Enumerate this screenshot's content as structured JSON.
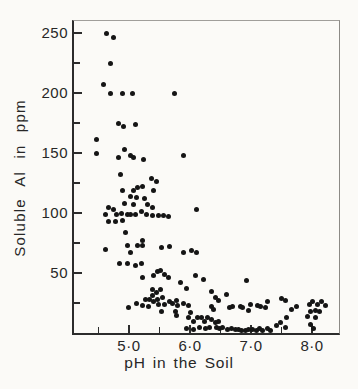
{
  "figure": {
    "colors": {
      "paper": "#fbfaf7",
      "ink": "#272727",
      "dot": "#151515",
      "axis": "#2c2c2c"
    }
  },
  "chart_data": {
    "type": "scatter",
    "title": "",
    "xlabel": "pH in the Soil",
    "ylabel": "Soluble Al in ppm",
    "xlim": [
      4.1,
      8.44
    ],
    "ylim": [
      0,
      260
    ],
    "grid": false,
    "legend": "none",
    "x_major_ticks": [
      {
        "value": 5.0,
        "label": "5·0"
      },
      {
        "value": 6.0,
        "label": "6·0"
      },
      {
        "value": 7.0,
        "label": "7·0"
      },
      {
        "value": 8.0,
        "label": "8·0"
      }
    ],
    "x_minor_ticks": [
      4.5,
      5.5,
      6.5,
      7.5
    ],
    "y_major_ticks": [
      {
        "value": 50,
        "label": "50"
      },
      {
        "value": 100,
        "label": "100"
      },
      {
        "value": 150,
        "label": "150"
      },
      {
        "value": 200,
        "label": "200"
      },
      {
        "value": 250,
        "label": "250"
      }
    ],
    "y_minor_ticks": [
      25,
      75,
      125,
      175,
      225
    ],
    "points": [
      [
        4.64,
        250
      ],
      [
        4.74,
        246
      ],
      [
        4.7,
        225
      ],
      [
        4.58,
        207
      ],
      [
        4.7,
        200
      ],
      [
        4.9,
        200
      ],
      [
        5.05,
        200
      ],
      [
        5.75,
        200
      ],
      [
        4.83,
        175
      ],
      [
        4.91,
        172
      ],
      [
        5.1,
        174
      ],
      [
        4.47,
        161
      ],
      [
        4.47,
        150
      ],
      [
        4.93,
        153
      ],
      [
        5.02,
        148
      ],
      [
        4.83,
        146
      ],
      [
        5.08,
        146
      ],
      [
        5.24,
        145
      ],
      [
        5.89,
        148
      ],
      [
        4.86,
        132
      ],
      [
        5.37,
        129
      ],
      [
        5.45,
        126
      ],
      [
        4.9,
        119
      ],
      [
        5.08,
        119
      ],
      [
        5.14,
        121
      ],
      [
        5.22,
        122
      ],
      [
        5.4,
        119
      ],
      [
        5.03,
        114
      ],
      [
        5.13,
        113
      ],
      [
        5.25,
        112
      ],
      [
        4.92,
        108
      ],
      [
        5.08,
        107
      ],
      [
        5.31,
        107
      ],
      [
        5.38,
        105
      ],
      [
        4.67,
        105
      ],
      [
        4.75,
        103
      ],
      [
        6.1,
        103
      ],
      [
        4.62,
        99
      ],
      [
        4.8,
        99
      ],
      [
        4.87,
        100
      ],
      [
        4.97,
        99
      ],
      [
        5.03,
        99
      ],
      [
        5.1,
        99
      ],
      [
        5.21,
        101
      ],
      [
        5.28,
        99
      ],
      [
        5.39,
        98
      ],
      [
        5.48,
        98
      ],
      [
        5.56,
        98
      ],
      [
        5.64,
        97
      ],
      [
        4.67,
        93
      ],
      [
        4.78,
        93
      ],
      [
        4.9,
        94
      ],
      [
        4.94,
        84
      ],
      [
        5.23,
        77
      ],
      [
        4.98,
        73
      ],
      [
        5.14,
        73
      ],
      [
        5.23,
        73
      ],
      [
        5.53,
        71
      ],
      [
        5.66,
        72
      ],
      [
        4.62,
        70
      ],
      [
        5.03,
        67
      ],
      [
        5.89,
        67
      ],
      [
        6.02,
        69
      ],
      [
        6.11,
        67
      ],
      [
        4.85,
        58
      ],
      [
        4.97,
        58
      ],
      [
        5.1,
        56
      ],
      [
        5.21,
        58
      ],
      [
        5.46,
        51
      ],
      [
        5.51,
        52
      ],
      [
        5.58,
        49
      ],
      [
        5.4,
        48
      ],
      [
        5.23,
        46
      ],
      [
        5.64,
        46
      ],
      [
        6.09,
        48
      ],
      [
        6.22,
        45
      ],
      [
        5.84,
        42
      ],
      [
        6.93,
        44
      ],
      [
        5.94,
        37
      ],
      [
        5.39,
        36
      ],
      [
        5.52,
        36
      ],
      [
        5.45,
        34
      ],
      [
        6.35,
        35
      ],
      [
        5.38,
        31
      ],
      [
        5.55,
        30
      ],
      [
        6.42,
        30
      ],
      [
        6.6,
        32
      ],
      [
        7.5,
        29
      ],
      [
        7.56,
        27
      ],
      [
        5.27,
        28
      ],
      [
        5.34,
        28
      ],
      [
        5.47,
        28
      ],
      [
        5.78,
        27
      ],
      [
        6.47,
        27
      ],
      [
        7.27,
        26
      ],
      [
        5.41,
        26
      ],
      [
        5.89,
        25
      ],
      [
        5.66,
        26
      ],
      [
        5.71,
        25
      ],
      [
        5.12,
        25
      ],
      [
        5.49,
        24
      ],
      [
        5.58,
        24
      ],
      [
        6.99,
        24
      ],
      [
        5.79,
        23
      ],
      [
        5.97,
        23
      ],
      [
        5.23,
        23
      ],
      [
        7.1,
        23
      ],
      [
        5.32,
        22
      ],
      [
        6.35,
        22
      ],
      [
        6.7,
        22
      ],
      [
        6.82,
        22
      ],
      [
        7.16,
        22
      ],
      [
        7.24,
        21
      ],
      [
        6.64,
        21
      ],
      [
        6.86,
        21
      ],
      [
        4.99,
        21
      ],
      [
        6.39,
        20
      ],
      [
        6.96,
        19
      ],
      [
        7.66,
        20
      ],
      [
        5.53,
        18
      ],
      [
        5.76,
        18
      ],
      [
        6.01,
        17
      ],
      [
        5.78,
        15
      ],
      [
        5.97,
        13
      ],
      [
        6.13,
        13
      ],
      [
        6.18,
        13
      ],
      [
        6.28,
        13
      ],
      [
        7.58,
        13
      ],
      [
        6.23,
        10
      ],
      [
        6.35,
        11
      ],
      [
        6.46,
        10
      ],
      [
        6.05,
        10
      ],
      [
        6.41,
        9
      ],
      [
        7.49,
        9
      ],
      [
        7.42,
        6
      ],
      [
        5.94,
        4
      ],
      [
        6.05,
        3
      ],
      [
        6.15,
        5
      ],
      [
        6.26,
        4
      ],
      [
        6.32,
        5
      ],
      [
        6.44,
        5
      ],
      [
        6.49,
        4
      ],
      [
        6.54,
        5
      ],
      [
        7.56,
        5
      ],
      [
        6.62,
        3
      ],
      [
        6.68,
        4
      ],
      [
        6.75,
        3
      ],
      [
        6.8,
        3
      ],
      [
        6.85,
        2.5
      ],
      [
        6.91,
        2.5
      ],
      [
        6.96,
        3
      ],
      [
        7.03,
        3
      ],
      [
        7.09,
        2.5
      ],
      [
        7.13,
        4
      ],
      [
        7.19,
        2.5
      ],
      [
        7.27,
        4
      ],
      [
        7.32,
        2.5
      ],
      [
        7.75,
        22
      ],
      [
        7.95,
        24
      ],
      [
        8.01,
        26
      ],
      [
        8.09,
        24
      ],
      [
        8.16,
        26
      ],
      [
        8.22,
        23
      ],
      [
        7.98,
        18
      ],
      [
        8.05,
        19
      ],
      [
        8.12,
        18
      ],
      [
        7.92,
        14
      ],
      [
        8.06,
        13
      ],
      [
        7.97,
        7
      ],
      [
        8.03,
        4
      ]
    ]
  }
}
